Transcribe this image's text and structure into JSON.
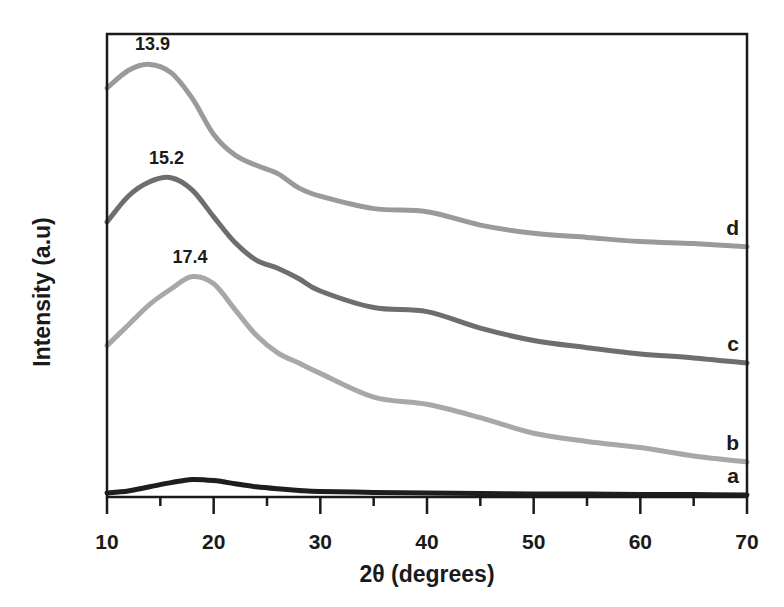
{
  "chart_data": {
    "type": "line",
    "title": "",
    "xlabel": "2θ (degrees)",
    "ylabel": "Intensity (a.u)",
    "xlim": [
      10,
      70
    ],
    "xticks": [
      10,
      20,
      30,
      40,
      50,
      60,
      70
    ],
    "xtick_labels": [
      "10",
      "20",
      "30",
      "40",
      "50",
      "60",
      "70"
    ],
    "minor_xticks": [
      15,
      25,
      35,
      45,
      55,
      65
    ],
    "yticks": [],
    "grid": false,
    "legend": "inline labels at right end of curves",
    "x": [
      10,
      12,
      14,
      16,
      18,
      20,
      22,
      24,
      26,
      28,
      30,
      35,
      40,
      45,
      50,
      55,
      60,
      65,
      70
    ],
    "series": [
      {
        "name": "a",
        "color": "#1e1e1e",
        "peak_label": null,
        "values": [
          2,
          4,
          8,
          12,
          15,
          14,
          11,
          8,
          6,
          4.5,
          3.5,
          2.5,
          2,
          1.5,
          1,
          1,
          0.5,
          0.5,
          0
        ]
      },
      {
        "name": "b",
        "color": "#a8a8a8",
        "peak_label": "17.4",
        "peak_x": 17.4,
        "values": [
          145,
          165,
          185,
          200,
          212,
          205,
          180,
          155,
          138,
          128,
          118,
          95,
          88,
          75,
          60,
          52,
          46,
          38,
          32
        ]
      },
      {
        "name": "c",
        "color": "#6e6e6e",
        "peak_label": "15.2",
        "peak_x": 15.2,
        "values": [
          265,
          290,
          304,
          308,
          296,
          270,
          245,
          228,
          220,
          210,
          198,
          182,
          178,
          162,
          150,
          143,
          137,
          133,
          128
        ]
      },
      {
        "name": "d",
        "color": "#9a9a9a",
        "peak_label": "13.9",
        "peak_x": 13.9,
        "values": [
          395,
          412,
          418,
          410,
          385,
          350,
          330,
          320,
          312,
          298,
          290,
          278,
          275,
          262,
          254,
          250,
          246,
          244,
          241
        ]
      }
    ],
    "annotations": [
      {
        "text": "13.9",
        "series": "d"
      },
      {
        "text": "15.2",
        "series": "c"
      },
      {
        "text": "17.4",
        "series": "b"
      }
    ]
  }
}
